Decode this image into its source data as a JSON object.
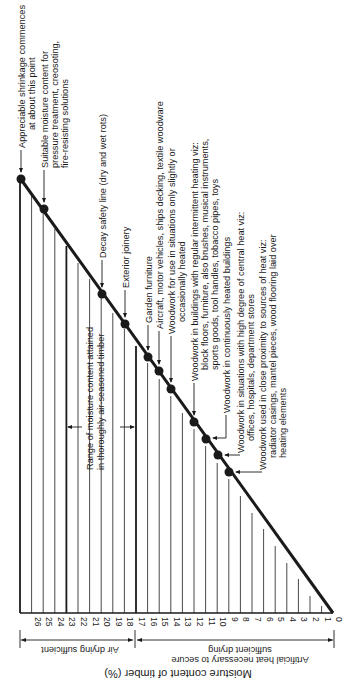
{
  "diagram": {
    "axis_title": "Moisture content of timber (%)",
    "ticks": [
      "27",
      "26",
      "25",
      "24",
      "23",
      "22",
      "21",
      "20",
      "19",
      "18",
      "17",
      "16",
      "15",
      "14",
      "13",
      "12",
      "11",
      "10",
      "9",
      "8",
      "7",
      "6",
      "5",
      "4",
      "3",
      "2",
      "1",
      "0"
    ],
    "zones": {
      "air_drying": "Air drying sufficient",
      "artificial_line1": "Artificial heat necessary to secure",
      "artificial_line2": "sufficient drying"
    },
    "range_label": {
      "line1": "Range of moisture content attained",
      "line2": "in thoroughly air-seasoned timber"
    },
    "annotations": [
      {
        "value": 27,
        "lines": [
          "Appreciable shrinkage commences",
          "at about this point"
        ]
      },
      {
        "value": 25,
        "lines": [
          "Suitable moisture content for",
          "pressure treatment, creosoting,",
          "fire-resisting solutions"
        ]
      },
      {
        "value": 20,
        "lines": [
          "Decay safety line (dry and wet rots)"
        ]
      },
      {
        "value": 18,
        "lines": [
          "Exterior joinery"
        ]
      },
      {
        "value": 16,
        "lines": [
          "Garden furniture"
        ]
      },
      {
        "value": 15,
        "lines": [
          "Aircraft, motor vehicles, ships decking, textile woodware"
        ]
      },
      {
        "value": 14,
        "lines": [
          "Woodwork for use in situations only slightly or",
          "occasionally heated"
        ]
      },
      {
        "value": 12,
        "lines": [
          "Woodwork in buildings with regular intermittent heating viz:",
          "block floors, furniture, also brushes, musical instruments,",
          "sports goods, tool handles, tobacco pipes, toys"
        ]
      },
      {
        "value": 11,
        "lines": [
          "Woodwork in continuously heated buildings"
        ]
      },
      {
        "value": 10,
        "lines": [
          "Woodwork in situations with high degree of central heat viz:",
          "offices, hospitals, department stores"
        ]
      },
      {
        "value": 9,
        "lines": [
          "Woodwork used in close proximity to sources of heat viz:",
          "radiator casings, mantel pieces, wood flooring laid over",
          "heating elements"
        ]
      }
    ],
    "colors": {
      "ink": "#1a1a1a",
      "background": "#ffffff"
    }
  }
}
